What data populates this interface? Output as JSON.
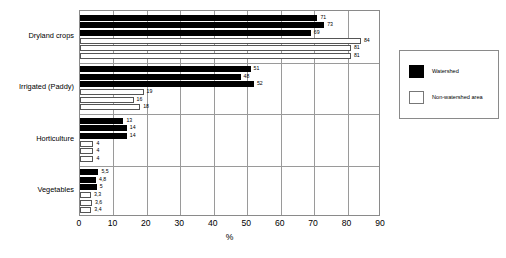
{
  "chart_data": {
    "type": "bar",
    "orientation": "horizontal",
    "title": "",
    "xlabel": "%",
    "ylabel": "",
    "xlim": [
      0,
      90
    ],
    "xticks": [
      0,
      10,
      20,
      30,
      40,
      50,
      60,
      70,
      80,
      90
    ],
    "grid": true,
    "grid_axis": "x",
    "legend_position": "right",
    "categories": [
      "Dryland crops",
      "Irrigated (Paddy)",
      "Horticulture",
      "Vegetables"
    ],
    "series": [
      {
        "name": "Watershed",
        "color": "#000000",
        "groups": [
          {
            "category": "Dryland crops",
            "values": [
              71,
              73,
              69
            ]
          },
          {
            "category": "Irrigated (Paddy)",
            "values": [
              51,
              48,
              52
            ]
          },
          {
            "category": "Horticulture",
            "values": [
              13,
              14,
              14
            ]
          },
          {
            "category": "Vegetables",
            "values": [
              5.5,
              4.8,
              5
            ]
          }
        ]
      },
      {
        "name": "Non-watershed area",
        "color": "#ffffff",
        "groups": [
          {
            "category": "Dryland crops",
            "values": [
              84,
              81,
              81
            ]
          },
          {
            "category": "Irrigated (Paddy)",
            "values": [
              19,
              16,
              18
            ]
          },
          {
            "category": "Horticulture",
            "values": [
              4,
              4,
              4
            ]
          },
          {
            "category": "Vegetables",
            "values": [
              3.3,
              3.6,
              3.4
            ]
          }
        ]
      }
    ],
    "bar_labels": {
      "dryland_watershed": [
        "71",
        "73",
        "69"
      ],
      "dryland_nonwatershed": [
        "84",
        "81",
        "81"
      ],
      "irrigated_watershed": [
        "51",
        "48",
        "52"
      ],
      "irrigated_nonwatershed": [
        "19",
        "16",
        "18"
      ],
      "horticulture_watershed": [
        "13",
        "14",
        "14"
      ],
      "horticulture_nonwatershed": [
        "4",
        "4",
        "4"
      ],
      "vegetables_watershed": [
        "5,5",
        "4,8",
        "5"
      ],
      "vegetables_nonwatershed": [
        "3,3",
        "3,6",
        "3,4"
      ]
    }
  },
  "axis": {
    "x_title": "%",
    "x_ticks": [
      "0",
      "10",
      "20",
      "30",
      "40",
      "50",
      "60",
      "70",
      "80",
      "90"
    ],
    "y_categories": [
      "Dryland crops",
      "Irrigated (Paddy)",
      "Horticulture",
      "Vegetables"
    ]
  },
  "legend": {
    "items": [
      {
        "label": "Watershed",
        "swatch": "black-square"
      },
      {
        "label": "Non-watershed area",
        "swatch": "white-square"
      }
    ]
  }
}
